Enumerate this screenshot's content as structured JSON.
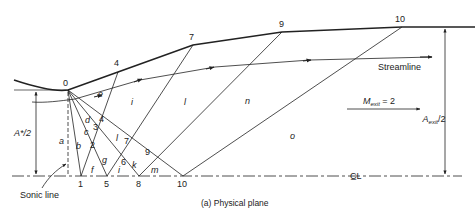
{
  "figure": {
    "caption": "(a)  Physical plane",
    "wall_points": [
      {
        "label": "0",
        "x": 68,
        "y": 90
      },
      {
        "label": "4",
        "x": 118,
        "y": 72
      },
      {
        "label": "7",
        "x": 193,
        "y": 45
      },
      {
        "label": "9",
        "x": 282,
        "y": 32
      },
      {
        "label": "10",
        "x": 402,
        "y": 27
      }
    ],
    "axis_points": [
      {
        "label": "1",
        "x": 81,
        "y": 176
      },
      {
        "label": "5",
        "x": 107,
        "y": 176
      },
      {
        "label": "8",
        "x": 139,
        "y": 176
      },
      {
        "label": "10",
        "x": 183,
        "y": 176
      }
    ],
    "interior_points": [
      {
        "label": "2",
        "x": 89,
        "y": 136
      },
      {
        "label": "3",
        "x": 94,
        "y": 122
      },
      {
        "label": "4",
        "x": 97,
        "y": 114
      },
      {
        "label": "6",
        "x": 124,
        "y": 159
      },
      {
        "label": "7",
        "x": 128,
        "y": 146
      },
      {
        "label": "9",
        "x": 149,
        "y": 152
      }
    ],
    "region_labels": [
      {
        "label": "a",
        "x": 61,
        "y": 140
      },
      {
        "label": "b",
        "x": 78,
        "y": 143
      },
      {
        "label": "c",
        "x": 84,
        "y": 127
      },
      {
        "label": "d",
        "x": 86,
        "y": 118
      },
      {
        "label": "e",
        "x": 100,
        "y": 96
      },
      {
        "label": "f",
        "x": 92,
        "y": 172
      },
      {
        "label": "g",
        "x": 104,
        "y": 160
      },
      {
        "label": "i",
        "x": 133,
        "y": 105
      },
      {
        "label": "i",
        "x": 119,
        "y": 170
      },
      {
        "label": "k",
        "x": 133,
        "y": 168
      },
      {
        "label": "l",
        "x": 117,
        "y": 141
      },
      {
        "label": "l",
        "x": 185,
        "y": 105
      },
      {
        "label": "m",
        "x": 153,
        "y": 173
      },
      {
        "label": "n",
        "x": 247,
        "y": 104
      },
      {
        "label": "o",
        "x": 292,
        "y": 139
      }
    ],
    "labels": {
      "streamline": "Streamline",
      "mach_exit": "M",
      "mach_exit_sub": "exit",
      "mach_exit_value": " = 2",
      "throat_area": "A*/2",
      "exit_area": "A",
      "exit_area_sub": "exit",
      "exit_area_suffix": "/2",
      "sonic_line": "Sonic line",
      "centerline": "C̲L"
    },
    "colors": {
      "ink": "#222222",
      "background": "#ffffff"
    }
  }
}
